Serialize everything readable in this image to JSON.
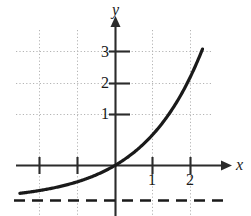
{
  "figure": {
    "name": "exponential-function-graph",
    "type": "math-graph"
  },
  "chart_data": {
    "type": "line",
    "title": "",
    "xlabel": "x",
    "ylabel": "y",
    "xlim": [
      -2.55,
      2.95
    ],
    "ylim": [
      -1.6,
      3.65
    ],
    "grid": true,
    "grid_style": "dotted",
    "legend": null,
    "x_ticks": [
      1,
      2
    ],
    "x_tick_labels": [
      "1",
      "2"
    ],
    "y_ticks": [
      1,
      2,
      3
    ],
    "y_tick_labels": [
      "1",
      "2",
      "3"
    ],
    "series": [
      {
        "name": "exponential-curve",
        "color": "#1a1a1a",
        "line_width": 3,
        "points": [
          [
            -2.55,
            -0.94
          ],
          [
            -2.2,
            -0.9
          ],
          [
            -1.9,
            -0.85
          ],
          [
            -1.6,
            -0.79
          ],
          [
            -1.3,
            -0.71
          ],
          [
            -1.0,
            -0.6
          ],
          [
            -0.7,
            -0.46
          ],
          [
            -0.4,
            -0.27
          ],
          [
            -0.2,
            -0.11
          ],
          [
            0.0,
            0.08
          ],
          [
            0.2,
            0.3
          ],
          [
            0.4,
            0.55
          ],
          [
            0.6,
            0.82
          ],
          [
            0.8,
            1.13
          ],
          [
            1.0,
            1.0
          ],
          [
            1.2,
            1.3
          ],
          [
            1.4,
            1.62
          ],
          [
            1.6,
            1.98
          ],
          [
            1.8,
            2.38
          ],
          [
            2.0,
            2.85
          ],
          [
            2.2,
            3.38
          ],
          [
            2.3,
            3.62
          ]
        ]
      }
    ],
    "asymptote": {
      "name": "horizontal-asymptote",
      "orientation": "horizontal",
      "value": -1.12,
      "style": "dashed",
      "color": "#1a1a1a"
    },
    "annotations": []
  },
  "labels": {
    "y_axis": "y",
    "x_axis": "x",
    "y_3": "3",
    "y_2": "2",
    "y_1": "1",
    "x_1": "1",
    "x_2": "2"
  },
  "colors": {
    "curve": "#1a1a1a",
    "axis": "#2b2b2b",
    "grid": "#b0b0b0",
    "background": "#ffffff"
  }
}
